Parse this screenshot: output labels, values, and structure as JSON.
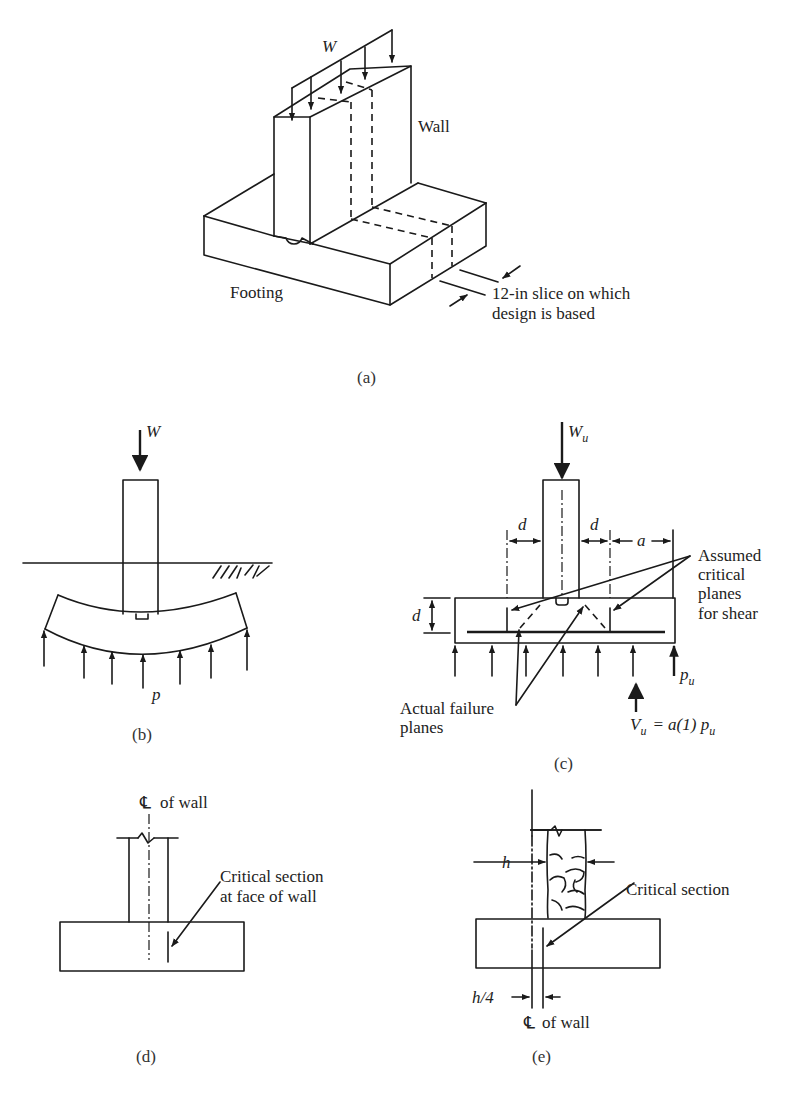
{
  "figure": {
    "panel_a": {
      "caption": "(a)",
      "load_label": "W",
      "wall_label": "Wall",
      "footing_label": "Footing",
      "slice_note_line1": "12-in slice on which",
      "slice_note_line2": "design is based"
    },
    "panel_b": {
      "caption": "(b)",
      "load_label": "W",
      "pressure_label": "p"
    },
    "panel_c": {
      "caption": "(c)",
      "load_label": "W",
      "load_sub": "u",
      "d_left": "d",
      "d_right": "d",
      "a_label": "a",
      "d_vertical": "d",
      "assumed_line1": "Assumed",
      "assumed_line2": "critical",
      "assumed_line3": "planes",
      "assumed_line4": "for shear",
      "actual_line1": "Actual failure",
      "actual_line2": "planes",
      "pressure_label": "p",
      "pressure_sub": "u",
      "shear_V": "V",
      "shear_sub": "u",
      "shear_eq": "= a(1) p",
      "shear_eq_sub": "u"
    },
    "panel_d": {
      "caption": "(d)",
      "centerline_symbol": "℄",
      "centerline_label": "of wall",
      "critical_line1": "Critical section",
      "critical_line2": "at face of wall"
    },
    "panel_e": {
      "caption": "(e)",
      "h_label": "h",
      "h4_label": "h/4",
      "centerline_symbol": "℄",
      "centerline_label": "of wall",
      "critical_label": "Critical section"
    }
  }
}
